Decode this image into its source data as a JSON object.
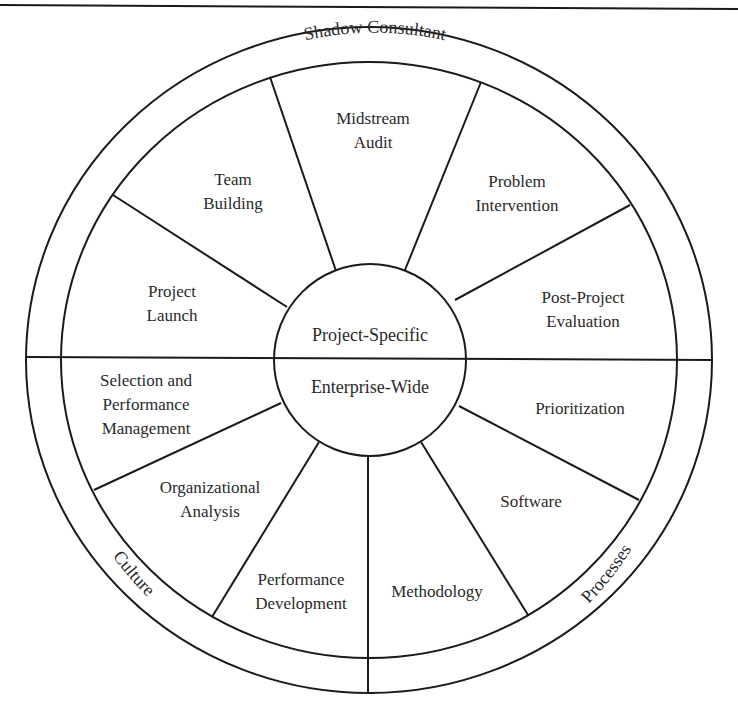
{
  "diagram": {
    "core": {
      "top": "Project-Specific",
      "bottom": "Enterprise-Wide"
    },
    "ring_labels": {
      "top": "Shadow Consultant",
      "bottom_left": "Culture",
      "bottom_right": "Processes"
    },
    "project_specific_segments": [
      {
        "lines": [
          "Project",
          "Launch"
        ]
      },
      {
        "lines": [
          "Team",
          "Building"
        ]
      },
      {
        "lines": [
          "Midstream",
          "Audit"
        ]
      },
      {
        "lines": [
          "Problem",
          "Intervention"
        ]
      },
      {
        "lines": [
          "Post-Project",
          "Evaluation"
        ]
      }
    ],
    "enterprise_wide_segments": [
      {
        "lines": [
          "Selection and",
          "Performance",
          "Management"
        ]
      },
      {
        "lines": [
          "Organizational",
          "Analysis"
        ]
      },
      {
        "lines": [
          "Performance",
          "Development"
        ]
      },
      {
        "lines": [
          "Methodology"
        ]
      },
      {
        "lines": [
          "Software"
        ]
      },
      {
        "lines": [
          "Prioritization"
        ]
      }
    ],
    "colors": {
      "stroke": "#1a1a1a",
      "text": "#2a2a2a",
      "background": "#ffffff"
    }
  }
}
